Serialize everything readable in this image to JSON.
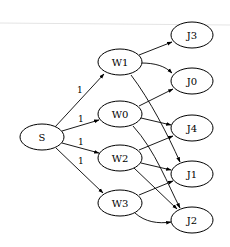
{
  "diagram": {
    "type": "directed-graph",
    "nodes": [
      {
        "id": "S",
        "label": "S",
        "cx": 42,
        "cy": 137
      },
      {
        "id": "W1",
        "label": "W1",
        "cx": 120,
        "cy": 62
      },
      {
        "id": "W0",
        "label": "W0",
        "cx": 120,
        "cy": 114
      },
      {
        "id": "W2",
        "label": "W2",
        "cx": 120,
        "cy": 158
      },
      {
        "id": "W3",
        "label": "W3",
        "cx": 120,
        "cy": 203
      },
      {
        "id": "J3",
        "label": "J3",
        "cx": 192,
        "cy": 35
      },
      {
        "id": "J0",
        "label": "J0",
        "cx": 192,
        "cy": 81
      },
      {
        "id": "J4",
        "label": "J4",
        "cx": 192,
        "cy": 128
      },
      {
        "id": "J1",
        "label": "J1",
        "cx": 192,
        "cy": 174
      },
      {
        "id": "J2",
        "label": "J2",
        "cx": 192,
        "cy": 220
      }
    ],
    "edges": [
      {
        "from": "S",
        "to": "W1",
        "label": "1"
      },
      {
        "from": "S",
        "to": "W0",
        "label": "1"
      },
      {
        "from": "S",
        "to": "W2",
        "label": "1"
      },
      {
        "from": "S",
        "to": "W3",
        "label": "1"
      },
      {
        "from": "W1",
        "to": "J3",
        "label": ""
      },
      {
        "from": "W1",
        "to": "J0",
        "label": ""
      },
      {
        "from": "W1",
        "to": "J1",
        "label": ""
      },
      {
        "from": "W0",
        "to": "J0",
        "label": ""
      },
      {
        "from": "W0",
        "to": "J4",
        "label": ""
      },
      {
        "from": "W0",
        "to": "J2",
        "label": ""
      },
      {
        "from": "W2",
        "to": "J4",
        "label": ""
      },
      {
        "from": "W2",
        "to": "J1",
        "label": ""
      },
      {
        "from": "W2",
        "to": "J2",
        "label": ""
      },
      {
        "from": "W3",
        "to": "J1",
        "label": ""
      },
      {
        "from": "W3",
        "to": "J2",
        "label": ""
      }
    ],
    "edge_labels": {
      "s_w1": "1",
      "s_w0": "1",
      "s_w2": "1",
      "s_w3": "1"
    },
    "node_labels": {
      "S": "S",
      "W1": "W1",
      "W0": "W0",
      "W2": "W2",
      "W3": "W3",
      "J3": "J3",
      "J0": "J0",
      "J4": "J4",
      "J1": "J1",
      "J2": "J2"
    },
    "colors": {
      "stroke": "#000000",
      "fill": "#ffffff",
      "background": "#ffffff"
    }
  }
}
